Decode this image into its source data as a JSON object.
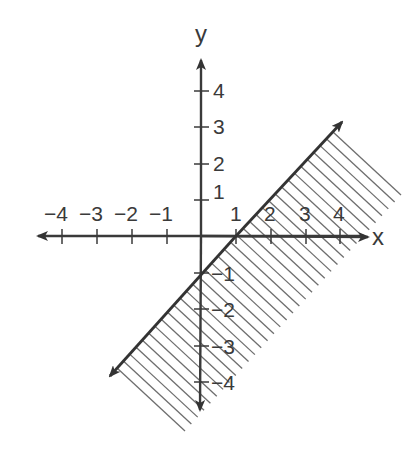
{
  "chart_data": {
    "type": "line",
    "title": "",
    "xlabel": "x",
    "ylabel": "y",
    "xlim": [
      -4,
      4
    ],
    "ylim": [
      -4,
      4
    ],
    "grid": false,
    "x_ticks": [
      -4,
      -3,
      -2,
      -1,
      1,
      2,
      3,
      4
    ],
    "y_ticks": [
      -4,
      -3,
      -2,
      -1,
      1,
      2,
      3,
      4
    ],
    "x_tick_labels": [
      "−4",
      "−3",
      "−2",
      "−1",
      "1",
      "2",
      "3",
      "4"
    ],
    "y_tick_labels": [
      "4",
      "3",
      "2",
      "1",
      "−1",
      "−2",
      "−3",
      "−4"
    ],
    "series": [
      {
        "name": "boundary line y = x - 1",
        "style": "solid",
        "x": [
          -2.6,
          4.0
        ],
        "y": [
          -3.6,
          3.2
        ],
        "points_on_line": [
          [
            1,
            0
          ],
          [
            0,
            -1
          ]
        ]
      }
    ],
    "shaded_region": {
      "description": "half-plane below/right of the line",
      "inequality": "y <= x - 1",
      "pattern": "diagonal hatch"
    },
    "colors": {
      "axis": "#3a3a3a",
      "line": "#333333",
      "hatch": "#6e6e6e",
      "background": "#ffffff"
    }
  },
  "labels": {
    "x_axis": "x",
    "y_axis": "y",
    "x_neg4": "−4",
    "x_neg3": "−3",
    "x_neg2": "−2",
    "x_neg1": "−1",
    "x_1": "1",
    "x_2": "2",
    "x_3": "3",
    "x_4": "4",
    "y_4": "4",
    "y_3": "3",
    "y_2": "2",
    "y_1": "1",
    "y_neg1": "−1",
    "y_neg2": "−2",
    "y_neg3": "−3",
    "y_neg4": "−4"
  }
}
